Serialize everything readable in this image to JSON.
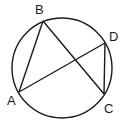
{
  "diagram": {
    "type": "inscribed-quadrilateral-chords",
    "circle": {
      "cx": 62,
      "cy": 68,
      "r": 50
    },
    "points": [
      {
        "name": "A",
        "x": 19,
        "y": 92,
        "label_x": 8,
        "label_y": 104
      },
      {
        "name": "B",
        "x": 43,
        "y": 21,
        "label_x": 35,
        "label_y": 14
      },
      {
        "name": "C",
        "x": 104,
        "y": 94,
        "label_x": 104,
        "label_y": 112
      },
      {
        "name": "D",
        "x": 105,
        "y": 43,
        "label_x": 109,
        "label_y": 40
      }
    ],
    "segments": [
      "AB",
      "BC",
      "AD",
      "DC"
    ],
    "stroke_color": "#1a1a1a"
  },
  "labels": {
    "A": "A",
    "B": "B",
    "C": "C",
    "D": "D"
  }
}
